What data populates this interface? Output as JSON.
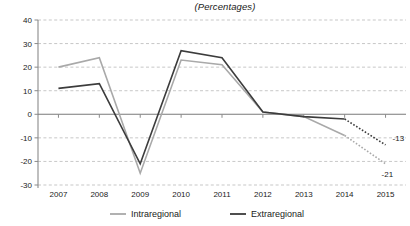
{
  "chart_data": {
    "type": "line",
    "title": "(Percentages)",
    "xlabel": "",
    "ylabel": "",
    "categories": [
      "2007",
      "2008",
      "2009",
      "2010",
      "2011",
      "2012",
      "2013",
      "2014",
      "2015"
    ],
    "ylim": [
      -30,
      40
    ],
    "yticks": [
      40,
      30,
      20,
      10,
      0,
      -10,
      -20,
      -30
    ],
    "ytick_labels": [
      "40",
      "30",
      "20",
      "10",
      "0",
      "-10",
      "-20",
      "-30"
    ],
    "grid": true,
    "legend_position": "bottom",
    "series": [
      {
        "name": "Intraregional",
        "color": "#a9a9a9",
        "values": [
          20,
          24,
          -25,
          23,
          21,
          1,
          -1,
          -9,
          -21
        ],
        "dashed_from_index": 7,
        "endpoint_label": "-21"
      },
      {
        "name": "Extraregional",
        "color": "#3c3c3c",
        "values": [
          11,
          13,
          -21,
          27,
          24,
          1,
          -1,
          -2,
          -13
        ],
        "dashed_from_index": 7,
        "endpoint_label": "-13"
      }
    ],
    "annotations": [
      {
        "text": "-13",
        "series": "Extraregional",
        "value": -13,
        "at": "2015"
      },
      {
        "text": "-21",
        "series": "Intraregional",
        "value": -21,
        "at": "2015"
      }
    ]
  },
  "legend": {
    "items": [
      {
        "label": "Intraregional",
        "color": "#a9a9a9"
      },
      {
        "label": "Extraregional",
        "color": "#3c3c3c"
      }
    ]
  }
}
